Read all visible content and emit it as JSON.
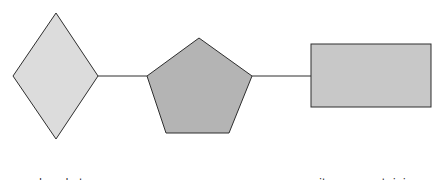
{
  "diagram": {
    "colors": {
      "phosphate_fill": "#dcdcdc",
      "sugar_fill": "#b4b4b4",
      "base_fill": "#c8c8c8",
      "stroke": "#2e2e2e",
      "text": "#2a2a2a"
    },
    "nodes": [
      {
        "id": "phosphate",
        "shape": "diamond",
        "label_line1": "phosphate",
        "label_line2": "group"
      },
      {
        "id": "sugar",
        "shape": "pentagon",
        "label_line1": "sugar",
        "label_line2": "(pentose)"
      },
      {
        "id": "base",
        "shape": "rectangle",
        "label_line1": "nitrogen-containing",
        "label_line2": "base"
      }
    ],
    "edges": [
      {
        "from": "phosphate",
        "to": "sugar"
      },
      {
        "from": "sugar",
        "to": "base"
      }
    ]
  }
}
